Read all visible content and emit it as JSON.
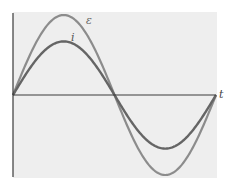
{
  "chart_data": {
    "type": "line",
    "title": "",
    "xlabel": "t",
    "ylabel": "",
    "grid": false,
    "legend": "inline labels",
    "x": [
      0,
      0.25,
      0.5,
      0.75,
      1.0
    ],
    "x_unit": "period fraction",
    "series": [
      {
        "name": "ε",
        "description": "emf",
        "amplitude": 1.0,
        "phase": 0,
        "values": [
          0,
          1.0,
          0,
          -1.0,
          0
        ],
        "color": "#8c8c8c"
      },
      {
        "name": "i",
        "description": "current",
        "amplitude": 0.67,
        "phase": 0,
        "values": [
          0,
          0.67,
          0,
          -0.67,
          0
        ],
        "color": "#656565"
      }
    ]
  },
  "labels": {
    "emf": "ε",
    "current": "i",
    "time_axis": "t"
  },
  "colors": {
    "panel_bg": "#eeeeee",
    "axis": "#3a3a3a",
    "emf_curve": "#8c8c8c",
    "current_curve": "#656565",
    "label_text": "#555555"
  }
}
